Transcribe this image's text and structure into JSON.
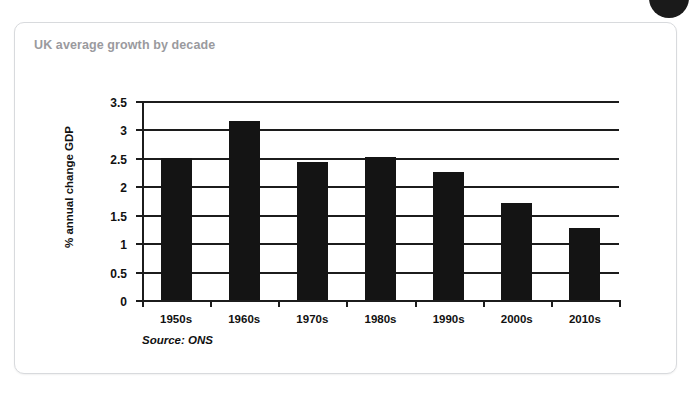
{
  "card": {
    "title": "UK average growth by decade",
    "border_color": "#d8dadd",
    "title_color": "#9a9a9e",
    "background": "#ffffff"
  },
  "decoration": {
    "corner_dot_color": "#1a1a1a",
    "corner_dot_name": "circle-badge"
  },
  "source_note": "Source: ONS",
  "chart_data": {
    "type": "bar",
    "title": "UK average growth by decade",
    "subtitle": "",
    "xlabel": "",
    "ylabel": "% annual change GDP",
    "categories": [
      "1950s",
      "1960s",
      "1970s",
      "1980s",
      "1990s",
      "2000s",
      "2010s"
    ],
    "values": [
      2.5,
      3.15,
      2.43,
      2.51,
      2.25,
      1.7,
      1.26
    ],
    "series": [
      {
        "name": "% annual change GDP",
        "values": [
          2.5,
          3.15,
          2.43,
          2.51,
          2.25,
          1.7,
          1.26
        ],
        "color": "#141414"
      }
    ],
    "ylim": [
      0,
      3.5
    ],
    "yticks": [
      0,
      0.5,
      1,
      1.5,
      2,
      2.5,
      3,
      3.5
    ],
    "ytick_labels": [
      "0",
      "0.5",
      "1",
      "1.5",
      "2",
      "2.5",
      "3",
      "3.5"
    ],
    "grid": true,
    "grid_axis": "y",
    "legend": false,
    "legend_position": "none",
    "bar_color": "#141414",
    "annotations": [
      "Source: ONS"
    ]
  }
}
